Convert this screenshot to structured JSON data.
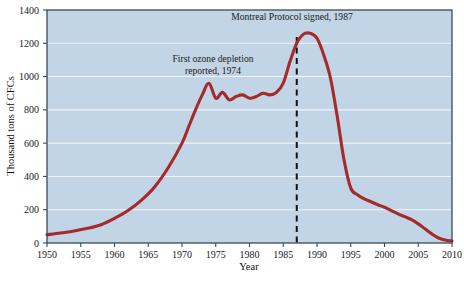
{
  "chart_data": {
    "type": "line",
    "title": "",
    "subtitle": "",
    "xlabel": "Year",
    "ylabel": "Thousand tons of CFCs",
    "xlim": [
      1950,
      2010
    ],
    "ylim": [
      0,
      1400
    ],
    "xticks": [
      1950,
      1955,
      1960,
      1965,
      1970,
      1975,
      1980,
      1985,
      1990,
      1995,
      2000,
      2005,
      2010
    ],
    "yticks": [
      0,
      200,
      400,
      600,
      800,
      1000,
      1200,
      1400
    ],
    "xtick_labels": [
      "1950",
      "1955",
      "1960",
      "1965",
      "1970",
      "1975",
      "1980",
      "1985",
      "1990",
      "1995",
      "2000",
      "2005",
      "2010"
    ],
    "ytick_labels": [
      "0",
      "200",
      "400",
      "600",
      "800",
      "1000",
      "1200",
      "1400"
    ],
    "grid": true,
    "grid_axis": "y",
    "legend": false,
    "legend_position": "none",
    "series": [
      {
        "name": "CFC production",
        "color": "#a52a2a",
        "x": [
          1950,
          1952,
          1954,
          1956,
          1958,
          1960,
          1962,
          1964,
          1966,
          1968,
          1970,
          1971,
          1972,
          1973,
          1974,
          1975,
          1976,
          1977,
          1978,
          1979,
          1980,
          1981,
          1982,
          1983,
          1984,
          1985,
          1986,
          1987,
          1988,
          1989,
          1990,
          1991,
          1992,
          1993,
          1994,
          1995,
          1996,
          1997,
          1998,
          1999,
          2000,
          2001,
          2002,
          2003,
          2004,
          2005,
          2006,
          2007,
          2008,
          2009,
          2010
        ],
        "y": [
          50,
          60,
          72,
          88,
          110,
          148,
          195,
          258,
          340,
          455,
          600,
          700,
          800,
          890,
          960,
          870,
          905,
          860,
          880,
          890,
          870,
          880,
          900,
          890,
          905,
          960,
          1090,
          1200,
          1255,
          1260,
          1230,
          1130,
          990,
          760,
          500,
          330,
          290,
          265,
          248,
          230,
          215,
          195,
          175,
          158,
          140,
          115,
          85,
          55,
          30,
          18,
          12
        ]
      }
    ],
    "annotations": [
      {
        "id": "ozone-depletion-note",
        "lines": [
          "First ozone depletion",
          "reported, 1974"
        ],
        "x_px": 213,
        "y_px": 62,
        "anchor": "middle"
      },
      {
        "id": "montreal-protocol-note",
        "lines": [
          "Montreal Protocol signed, 1987"
        ],
        "x_px": 292,
        "y_px": 20,
        "anchor": "middle"
      }
    ],
    "reference_lines": [
      {
        "id": "montreal-protocol-1987",
        "orientation": "vertical",
        "value": 1987,
        "style": "dashed",
        "color": "#111111",
        "label": "1987"
      }
    ],
    "colors": {
      "plot_background": "#c2d5e6",
      "page_background": "#ffffff",
      "line": "#a52a2a",
      "gridline": "#eef4fa",
      "axis": "#3a4a57",
      "text": "#1a1a1a",
      "reference_line": "#111111"
    }
  }
}
